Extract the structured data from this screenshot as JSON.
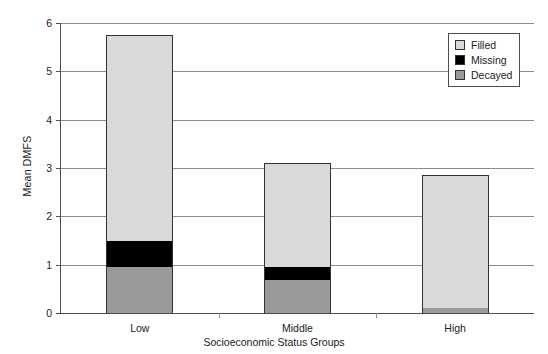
{
  "chart_data": {
    "type": "bar",
    "subtype": "stacked-bar",
    "title": "",
    "xlabel": "Socioeconomic Status Groups",
    "ylabel": "Mean DMFS",
    "categories": [
      "Low",
      "Middle",
      "High"
    ],
    "ylim": [
      0,
      6
    ],
    "yticks": [
      0,
      1,
      2,
      3,
      4,
      5,
      6
    ],
    "ytick_labels": [
      "0",
      "1",
      "2",
      "3",
      "4",
      "5",
      "6"
    ],
    "grid": "horizontal",
    "legend_position": "top-right",
    "stack_order_bottom_to_top": [
      "Decayed",
      "Missing",
      "Filled"
    ],
    "series": [
      {
        "name": "Decayed",
        "color": "#999999",
        "values": [
          0.95,
          0.68,
          0.1
        ]
      },
      {
        "name": "Missing",
        "color": "#000000",
        "values": [
          0.55,
          0.28,
          0.0
        ]
      },
      {
        "name": "Filled",
        "color": "#d9d9d9",
        "values": [
          4.25,
          2.15,
          2.76
        ]
      }
    ],
    "totals": [
      5.75,
      3.11,
      2.86
    ]
  },
  "legend": {
    "items": [
      {
        "label": "Filled",
        "swatch": "#d9d9d9"
      },
      {
        "label": "Missing",
        "swatch": "#000000"
      },
      {
        "label": "Decayed",
        "swatch": "#999999"
      }
    ]
  },
  "colors": {
    "filled": "#d9d9d9",
    "missing": "#000000",
    "decayed": "#999999",
    "axis": "#4d4d4d",
    "grid": "#8c8c8c",
    "background": "#ffffff"
  }
}
